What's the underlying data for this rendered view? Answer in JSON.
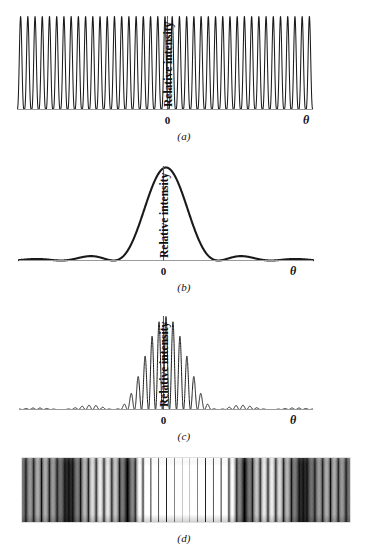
{
  "figure": {
    "background_color": "#ffffff",
    "curve_color": "#1a1a1a",
    "axis_color": "#9a9a9a"
  },
  "panels": [
    {
      "id": "a",
      "caption": "(a)",
      "ylabel": "Relative intensity",
      "origin_label": "0",
      "theta_label": "θ",
      "description": "Ideal double-slit interference fringes of equal height",
      "chart_data": {
        "type": "line",
        "title": "Double-slit interference (no diffraction)",
        "xlabel": "θ",
        "ylabel": "Relative intensity",
        "x_tick_labels": [
          "0",
          "θ"
        ],
        "x_tick_positions": [
          0.0,
          1.0
        ],
        "grid": false,
        "legend": null,
        "xlim": [
          -21,
          21
        ],
        "ylim": [
          0,
          1.05
        ],
        "formula": "I = cos^2(pi*m)",
        "fringe_count": 41,
        "fringe_spacing_units": 1.0,
        "peak_value": 1.0,
        "envelope": "none",
        "series": [
          {
            "name": "interference",
            "values": [
              1,
              1,
              1,
              1,
              1,
              1,
              1,
              1,
              1,
              1,
              1,
              1,
              1,
              1,
              1,
              1,
              1,
              1,
              1,
              1,
              1,
              1,
              1,
              1,
              1,
              1,
              1,
              1,
              1,
              1,
              1,
              1,
              1,
              1,
              1,
              1,
              1,
              1,
              1,
              1,
              1
            ]
          }
        ]
      }
    },
    {
      "id": "b",
      "caption": "(b)",
      "ylabel": "Relative intensity",
      "origin_label": "0",
      "theta_label": "θ",
      "description": "Single-slit diffraction envelope, broad central maximum with weak side lobes",
      "chart_data": {
        "type": "line",
        "title": "Single-slit diffraction envelope",
        "xlabel": "θ",
        "ylabel": "Relative intensity",
        "x_tick_labels": [
          "0",
          "θ"
        ],
        "x_tick_positions": [
          0.0,
          1.0
        ],
        "grid": false,
        "legend": null,
        "xlim": [
          -21,
          21
        ],
        "ylim": [
          0,
          1.05
        ],
        "formula": "I = (sin(alpha)/alpha)^2",
        "central_max_half_width_units": 7.5,
        "first_minima_units": [
          -7.5,
          7.5
        ],
        "second_minima_units": [
          -15,
          15
        ],
        "side_lobe_peak_relative": 0.047,
        "peak_value": 1.0,
        "series": [
          {
            "name": "diffraction-envelope",
            "sample_x": [
              -21,
              -18,
              -15,
              -12,
              -9,
              -7.5,
              -6,
              -4.5,
              -3,
              -1.5,
              0,
              1.5,
              3,
              4.5,
              6,
              7.5,
              9,
              12,
              15,
              18,
              21
            ],
            "values": [
              0.015,
              0.025,
              0.0,
              0.03,
              0.03,
              0.0,
              0.19,
              0.46,
              0.75,
              0.95,
              1.0,
              0.95,
              0.75,
              0.46,
              0.19,
              0.0,
              0.03,
              0.03,
              0.0,
              0.025,
              0.015
            ]
          }
        ]
      }
    },
    {
      "id": "c",
      "caption": "(c)",
      "ylabel": "Relative intensity",
      "origin_label": "0",
      "theta_label": "θ",
      "description": "Product of interference fringes and diffraction envelope; missing orders at envelope zeros",
      "chart_data": {
        "type": "line",
        "title": "Combined interference and diffraction pattern",
        "xlabel": "θ",
        "ylabel": "Relative intensity",
        "x_tick_labels": [
          "0",
          "θ"
        ],
        "x_tick_positions": [
          0.0,
          1.0
        ],
        "grid": false,
        "legend": null,
        "xlim": [
          -21,
          21
        ],
        "ylim": [
          0,
          1.05
        ],
        "formula": "I = cos^2(pi*m) * (sin(alpha)/alpha)^2",
        "fringe_count": 41,
        "missing_orders": [
          -15,
          -7.5,
          7.5,
          15
        ],
        "central_peak_index": 0,
        "envelope_first_zero_units": 7.5,
        "series": [
          {
            "name": "fringe-peak-heights",
            "orders": [
              -20,
              -19,
              -18,
              -17,
              -16,
              -15,
              -14,
              -13,
              -12,
              -11,
              -10,
              -9,
              -8,
              -7,
              -6,
              -5,
              -4,
              -3,
              -2,
              -1,
              0,
              1,
              2,
              3,
              4,
              5,
              6,
              7,
              8,
              9,
              10,
              11,
              12,
              13,
              14,
              15,
              16,
              17,
              18,
              19,
              20
            ],
            "values": [
              0.011,
              0.014,
              0.016,
              0.015,
              0.009,
              0.0,
              0.012,
              0.022,
              0.027,
              0.024,
              0.012,
              0.0,
              0.025,
              0.06,
              0.13,
              0.24,
              0.39,
              0.57,
              0.76,
              0.93,
              1.0,
              0.93,
              0.76,
              0.57,
              0.39,
              0.24,
              0.13,
              0.06,
              0.025,
              0.0,
              0.012,
              0.024,
              0.027,
              0.022,
              0.012,
              0.0,
              0.009,
              0.015,
              0.016,
              0.014,
              0.011
            ]
          }
        ]
      }
    },
    {
      "id": "d",
      "caption": "(d)",
      "type": "photograph",
      "description": "Photograph of the actual fringe pattern on a screen: bright and dark vertical bands",
      "chart_data": {
        "type": "heatmap",
        "title": "Photographic fringe pattern",
        "xlabel": "",
        "ylabel": "",
        "grid": false,
        "legend": null,
        "orientation": "horizontal-bands",
        "fringe_count": 41,
        "envelope_first_zero_units": 7.5,
        "max_intensity_color": "#ffffff",
        "min_intensity_color": "#000000"
      }
    }
  ]
}
